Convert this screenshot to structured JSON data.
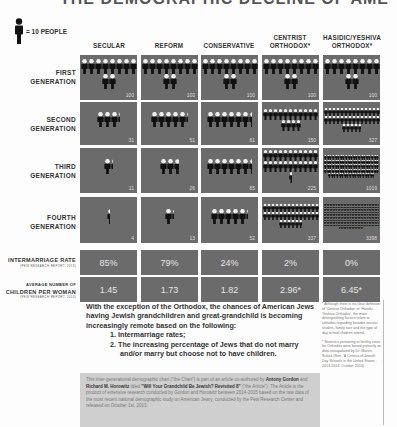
{
  "title": "THE DEMOGRAPHIC DECLINE OF AMERICAN JEWISH GENERATIONS",
  "legend": {
    "icon": "person-icon",
    "label": "= 10 PEOPLE"
  },
  "columns": [
    {
      "label": "SECULAR"
    },
    {
      "label": "REFORM"
    },
    {
      "label": "CONSERVATIVE"
    },
    {
      "label": "CENTRIST ORTHODOX*"
    },
    {
      "label": "HASIDIC/YESHIVA ORTHODOX*"
    }
  ],
  "rows": [
    {
      "label_1": "FIRST",
      "label_2": "GENERATION"
    },
    {
      "label_1": "SECOND",
      "label_2": "GENERATION"
    },
    {
      "label_1": "THIRD",
      "label_2": "GENERATION"
    },
    {
      "label_1": "FOURTH",
      "label_2": "GENERATION"
    }
  ],
  "stat_rows": [
    {
      "label": "INTERMARRIAGE RATE",
      "source": "(PEW RESEARCH REPORT, 2013)"
    },
    {
      "label_1": "AVERAGE NUMBER OF",
      "label_2": "CHILDREN PER WOMAN",
      "source": "(PEW RESEARCH REPORT, 2013)"
    }
  ],
  "chart_data": {
    "type": "table",
    "categories": [
      "Secular",
      "Reform",
      "Conservative",
      "Centrist Orthodox*",
      "Hasidic/Yeshiva Orthodox*"
    ],
    "series": [
      {
        "name": "First Generation",
        "values": [
          100,
          100,
          100,
          100,
          100
        ]
      },
      {
        "name": "Second Generation",
        "values": [
          31,
          51,
          61,
          150,
          327
        ]
      },
      {
        "name": "Third Generation",
        "values": [
          11,
          26,
          65,
          225,
          1019
        ]
      },
      {
        "name": "Fourth Generation",
        "values": [
          4,
          13,
          52,
          337,
          3398
        ]
      },
      {
        "name": "Intermarriage Rate",
        "values": [
          "85%",
          "79%",
          "24%",
          "2%",
          "0%"
        ]
      },
      {
        "name": "Average Number of Children per Woman",
        "values": [
          "1.45",
          "1.73",
          "1.82",
          "2.96*",
          "6.45*"
        ]
      }
    ],
    "units": "1 icon = 10 people"
  },
  "grid": [
    [
      "100",
      "100",
      "100",
      "100",
      "100"
    ],
    [
      "31",
      "51",
      "61",
      "150",
      "327"
    ],
    [
      "11",
      "26",
      "65",
      "225",
      "1019"
    ],
    [
      "4",
      "13",
      "52",
      "337",
      "3398"
    ]
  ],
  "intermarriage": [
    "85%",
    "79%",
    "24%",
    "2%",
    "0%"
  ],
  "children": [
    "1.45",
    "1.73",
    "1.82",
    "2.96*",
    "6.45*"
  ],
  "summary": {
    "intro": "With the exception of the Orthodox, the chances of American Jews having Jewish grandchildren and great-grandchild is becoming increasingly remote based on the following:",
    "points": [
      "1. Intermarriage rates;",
      "2. The increasing percentage of Jews that do not marry and/or marry but choose not to have children."
    ]
  },
  "note": {
    "pre": "This inter-generational demographic chart (\"the Chart\") is part of an article co-authored by ",
    "author1": "Antony Gordon",
    "mid1": " and ",
    "author2": "Richard M. Horowitz",
    "mid2": " titled ",
    "article": "\"Will Your Grandchild Be Jewish? Revisited 8\"",
    "post": " (\"the Article\"). The Article is the product of extensive research conducted by Gordon and Horowitz between 2014-2015 based on the raw data of the most recent national demographic study on American Jewry, conducted by the Pew Research Center and released on October 1st, 2013."
  },
  "footnotes": [
    "* Although there is no clear definition of 'Centrist Orthodox' or 'Hasidic - Yeshiva Orthodox', the main distinguishing factors relate to attitudes regarding broader secular studies, family size and the type of day school children attend.",
    "* Statistics pertaining to fertility rates for Orthodox were based primarily on data extrapolated by Dr. Marvin Schick (See: 'A Census of Jewish Day Schools in the United States - 2013-2014' October 2014)."
  ]
}
